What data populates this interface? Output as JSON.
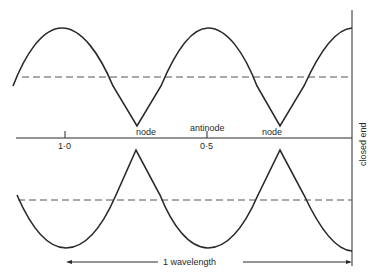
{
  "diagram": {
    "labels": {
      "node_left": "node",
      "node_right": "node",
      "antinode": "antinode",
      "tick_1": "1·0",
      "tick_2": "0·5",
      "closed_end": "closed end",
      "wavelength": "1 wavelength"
    },
    "colors": {
      "line": "#2a2a2a",
      "dash": "#555555",
      "background": "#ffffff"
    }
  }
}
